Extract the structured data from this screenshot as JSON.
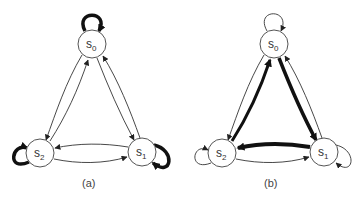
{
  "panels": [
    {
      "caption": "(a)",
      "offset_x": 0,
      "states": [
        {
          "id": "s0",
          "base": "s",
          "sub": "0",
          "cx": 92,
          "cy": 44
        },
        {
          "id": "s1",
          "base": "s",
          "sub": "1",
          "cx": 142,
          "cy": 152
        },
        {
          "id": "s2",
          "base": "s",
          "sub": "2",
          "cx": 40,
          "cy": 153
        }
      ],
      "edges": [
        {
          "from": "s0",
          "to": "s0",
          "weight": "thick"
        },
        {
          "from": "s1",
          "to": "s1",
          "weight": "thick"
        },
        {
          "from": "s2",
          "to": "s2",
          "weight": "thick"
        },
        {
          "from": "s0",
          "to": "s2",
          "weight": "thin"
        },
        {
          "from": "s2",
          "to": "s0",
          "weight": "thin"
        },
        {
          "from": "s0",
          "to": "s1",
          "weight": "thin"
        },
        {
          "from": "s1",
          "to": "s0",
          "weight": "thin"
        },
        {
          "from": "s1",
          "to": "s2",
          "weight": "thin"
        },
        {
          "from": "s2",
          "to": "s1",
          "weight": "thin"
        }
      ]
    },
    {
      "caption": "(b)",
      "offset_x": 182,
      "states": [
        {
          "id": "s0",
          "base": "s",
          "sub": "0",
          "cx": 274,
          "cy": 44
        },
        {
          "id": "s1",
          "base": "s",
          "sub": "1",
          "cx": 324,
          "cy": 152
        },
        {
          "id": "s2",
          "base": "s",
          "sub": "2",
          "cx": 222,
          "cy": 153
        }
      ],
      "edges": [
        {
          "from": "s0",
          "to": "s0",
          "weight": "thin"
        },
        {
          "from": "s1",
          "to": "s1",
          "weight": "thin"
        },
        {
          "from": "s2",
          "to": "s2",
          "weight": "thin"
        },
        {
          "from": "s0",
          "to": "s2",
          "weight": "thin"
        },
        {
          "from": "s2",
          "to": "s0",
          "weight": "thick"
        },
        {
          "from": "s0",
          "to": "s1",
          "weight": "thick"
        },
        {
          "from": "s1",
          "to": "s0",
          "weight": "thin"
        },
        {
          "from": "s1",
          "to": "s2",
          "weight": "thick"
        },
        {
          "from": "s2",
          "to": "s1",
          "weight": "thin"
        }
      ]
    }
  ]
}
